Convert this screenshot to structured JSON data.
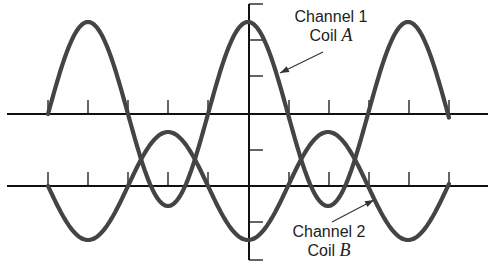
{
  "diagram": {
    "colors": {
      "axis": "#111111",
      "curve": "#444444",
      "arrow": "#333333",
      "background": "#ffffff"
    },
    "baselines": [
      {
        "name": "channel-1-baseline",
        "y": 114,
        "x_start": 7,
        "x_end": 488
      },
      {
        "name": "channel-2-baseline",
        "y": 186,
        "x_start": 7,
        "x_end": 488
      }
    ],
    "tick_x": [
      48,
      88,
      128,
      168,
      208,
      289,
      329,
      369,
      409,
      449
    ],
    "tick_height": 14,
    "vertical_axis": {
      "x": 249,
      "y_top": 4,
      "y_bottom": 260,
      "tick_y": [
        4,
        40,
        76,
        150,
        222,
        260
      ],
      "tick_length": 14
    },
    "waves": [
      {
        "name": "channel-1-coil-a-wave",
        "center_y": 114,
        "amplitude": 92,
        "period": 160,
        "x_start": 48,
        "x_end": 449,
        "phase_sign": -1
      },
      {
        "name": "channel-2-coil-b-wave",
        "center_y": 186,
        "amplitude": 54,
        "period": 160,
        "x_start": 48,
        "x_end": 449,
        "phase_sign": 1
      }
    ],
    "labels": {
      "channel_1": {
        "line1": "Channel 1",
        "line2_prefix": "Coil ",
        "line2_letter": "A"
      },
      "channel_2": {
        "line1": "Channel 2",
        "line2_prefix": "Coil ",
        "line2_letter": "B"
      }
    },
    "arrows": [
      {
        "name": "channel-1-pointer-arrow",
        "from": [
          323,
          52
        ],
        "to": [
          280,
          73
        ]
      },
      {
        "name": "channel-2-pointer-arrow",
        "from": [
          332,
          222
        ],
        "to": [
          374,
          200
        ]
      }
    ]
  }
}
